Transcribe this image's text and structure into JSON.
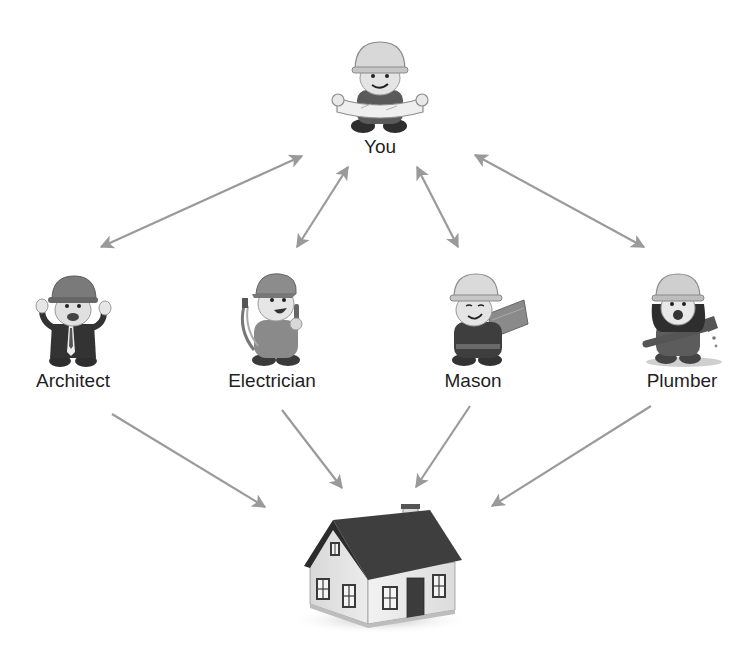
{
  "diagram": {
    "type": "hub-and-spoke relationship diagram",
    "arrow_color": "#9a9a9a",
    "text_color": "#1f1f1f",
    "nodes": {
      "you": {
        "label": "You",
        "icon": "construction-worker-with-blueprint-icon"
      },
      "architect": {
        "label": "Architect",
        "icon": "architect-worker-icon"
      },
      "electrician": {
        "label": "Electrician",
        "icon": "electrician-worker-icon"
      },
      "mason": {
        "label": "Mason",
        "icon": "mason-worker-icon"
      },
      "plumber": {
        "label": "Plumber",
        "icon": "plumber-worker-icon"
      },
      "house": {
        "label": "",
        "icon": "house-icon"
      }
    },
    "edges": [
      {
        "from": "you",
        "to": "architect",
        "style": "bidirectional"
      },
      {
        "from": "you",
        "to": "electrician",
        "style": "bidirectional"
      },
      {
        "from": "you",
        "to": "mason",
        "style": "bidirectional"
      },
      {
        "from": "you",
        "to": "plumber",
        "style": "bidirectional"
      },
      {
        "from": "architect",
        "to": "house",
        "style": "directed"
      },
      {
        "from": "electrician",
        "to": "house",
        "style": "directed"
      },
      {
        "from": "mason",
        "to": "house",
        "style": "directed"
      },
      {
        "from": "plumber",
        "to": "house",
        "style": "directed"
      }
    ]
  }
}
